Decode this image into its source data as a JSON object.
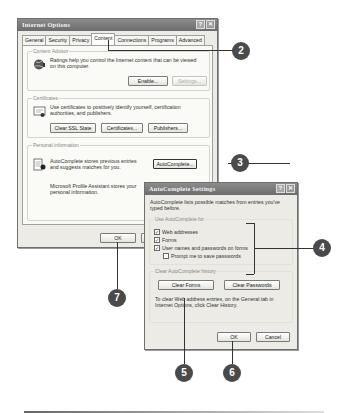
{
  "main_dialog": {
    "title": "Internet Options",
    "title_buttons": {
      "help": "?",
      "close": "✕"
    },
    "tabs": [
      {
        "label": "General",
        "active": false
      },
      {
        "label": "Security",
        "active": false
      },
      {
        "label": "Privacy",
        "active": false
      },
      {
        "label": "Content",
        "active": true
      },
      {
        "label": "Connections",
        "active": false
      },
      {
        "label": "Programs",
        "active": false
      },
      {
        "label": "Advanced",
        "active": false
      }
    ],
    "content_advisor": {
      "label": "Content Advisor",
      "icon": "content-advisor-globe-icon",
      "description": "Ratings help you control the Internet content that can be viewed on this computer.",
      "buttons": {
        "enable": "Enable...",
        "settings": "Settings..."
      }
    },
    "certificates": {
      "label": "Certificates",
      "icon": "certificate-icon",
      "description": "Use certificates to positively identify yourself, certification authorities, and publishers.",
      "buttons": {
        "clear_ssl": "Clear SSL State",
        "certificates": "Certificates...",
        "publishers": "Publishers..."
      }
    },
    "personal_information": {
      "label": "Personal information",
      "icon": "autocomplete-form-icon",
      "autocomplete_text": "AutoComplete stores previous entries and suggests matches for you.",
      "autocomplete_button": "AutoComplete...",
      "profile_text": "Microsoft Profile Assistant stores your personal information."
    },
    "footer_buttons": {
      "ok": "OK",
      "cancel": "Cancel"
    }
  },
  "autocomplete_dialog": {
    "title": "AutoComplete Settings",
    "title_buttons": {
      "help": "?",
      "close": "✕"
    },
    "intro": "AutoComplete lists possible matches from entries you've typed before.",
    "use_for": {
      "label": "Use AutoComplete for",
      "options": [
        {
          "label": "Web addresses",
          "checked": true
        },
        {
          "label": "Forms",
          "checked": true
        },
        {
          "label": "User names and passwords on forms",
          "checked": true
        },
        {
          "label": "Prompt me to save passwords",
          "checked": false
        }
      ]
    },
    "history": {
      "label": "Clear AutoComplete history",
      "clear_forms": "Clear Forms",
      "clear_passwords": "Clear Passwords",
      "note": "To clear Web address entries, on the General tab in Internet Options, click Clear History."
    },
    "footer_buttons": {
      "ok": "OK",
      "cancel": "Cancel"
    }
  },
  "callouts": [
    {
      "number": "2",
      "target": "Content tab"
    },
    {
      "number": "3",
      "target": "AutoComplete button"
    },
    {
      "number": "4",
      "target": "Use AutoComplete for checkboxes"
    },
    {
      "number": "5",
      "target": "Clear Forms button"
    },
    {
      "number": "6",
      "target": "OK button (AutoComplete Settings)"
    },
    {
      "number": "7",
      "target": "OK button (Internet Options)"
    }
  ]
}
